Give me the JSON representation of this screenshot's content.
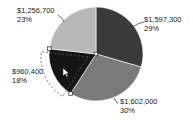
{
  "chart_data": {
    "type": "pie",
    "title": "",
    "start_angle_deg": 0,
    "direction": "clockwise",
    "categories": [
      "Slice 1",
      "Slice 2",
      "Slice 3",
      "Slice 4"
    ],
    "values": [
      1597300,
      1602000,
      960400,
      1256700
    ],
    "value_labels": [
      "$1,597,300",
      "$1,602,000",
      "$960,400",
      "$1,256,700"
    ],
    "percent_labels": [
      "29%",
      "30%",
      "18%",
      "23%"
    ],
    "colors": [
      "#3a3a3a",
      "#7a7a7a",
      "#151515",
      "#b8b8b8"
    ],
    "legend": null,
    "selected_slice_index": 2
  },
  "labels": {
    "slice1": {
      "value": "$1,597,300",
      "pct": "29%"
    },
    "slice2": {
      "value": "$1,602,000",
      "pct": "30%"
    },
    "slice3": {
      "value": "$960,400",
      "pct": "18%"
    },
    "slice4": {
      "value": "$1,256,700",
      "pct": "23%"
    }
  }
}
